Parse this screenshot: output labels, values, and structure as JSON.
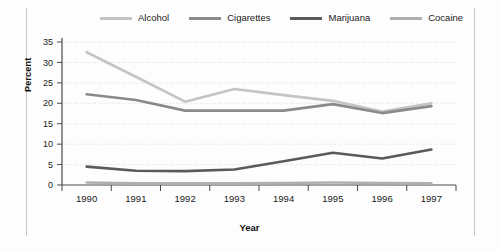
{
  "chart_data": {
    "type": "line",
    "title": "",
    "xlabel": "Year",
    "ylabel": "Percent",
    "categories": [
      "1990",
      "1991",
      "1992",
      "1993",
      "1994",
      "1995",
      "1996",
      "1997"
    ],
    "ylim": [
      0,
      35
    ],
    "yticks": [
      0,
      5,
      10,
      15,
      20,
      25,
      30,
      35
    ],
    "grid": true,
    "legend_position": "top",
    "series": [
      {
        "name": "Alcohol",
        "color": "#c4c4c4",
        "values": [
          32.5,
          26.5,
          20.4,
          23.5,
          22.0,
          20.6,
          18.0,
          20.0
        ]
      },
      {
        "name": "Cigarettes",
        "color": "#8a8a8a",
        "values": [
          22.2,
          20.8,
          18.2,
          18.2,
          18.2,
          19.8,
          17.6,
          19.3
        ]
      },
      {
        "name": "Marijuana",
        "color": "#5a5a5a",
        "values": [
          4.5,
          3.5,
          3.4,
          3.8,
          5.8,
          7.9,
          6.5,
          8.7
        ]
      },
      {
        "name": "Cocaine",
        "color": "#b0b0b0",
        "values": [
          0.6,
          0.4,
          0.4,
          0.4,
          0.5,
          0.6,
          0.5,
          0.4
        ]
      }
    ]
  },
  "axis": {
    "ylabel": "Percent",
    "xlabel": "Year"
  },
  "colors": {
    "background": "#fdfdfd",
    "grid": "#d8d8d8",
    "axis": "#4a4a4a",
    "frame": "#c9c9c9"
  }
}
